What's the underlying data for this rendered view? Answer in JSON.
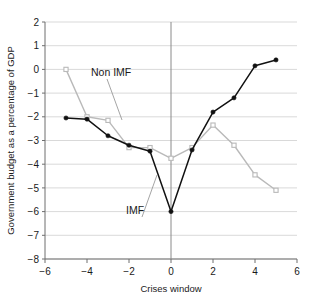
{
  "chart_data": {
    "type": "line",
    "title": "",
    "xlabel": "Crises window",
    "ylabel": "Government budget as a percentage of GDP",
    "xlim": [
      -6,
      6
    ],
    "ylim": [
      -8,
      2
    ],
    "xticks": [
      "-6",
      "-4",
      "-2",
      "0",
      "2",
      "4",
      "6"
    ],
    "xtick_values": [
      -6,
      -4,
      -2,
      0,
      2,
      4,
      6
    ],
    "yticks": [
      "2",
      "1",
      "0",
      "-1",
      "-2",
      "-3",
      "-4",
      "-5",
      "-6",
      "-7",
      "-8"
    ],
    "ytick_values": [
      2,
      1,
      0,
      -1,
      -2,
      -3,
      -4,
      -5,
      -6,
      -7,
      -8
    ],
    "grid": "horizontal",
    "legend_position": "inline-annotations",
    "x": [
      -5,
      -4,
      -3,
      -2,
      -1,
      0,
      1,
      2,
      3,
      4,
      5
    ],
    "series": [
      {
        "name": "IMF",
        "color": "#111111",
        "marker": "filled-circle",
        "values": [
          -2.05,
          -2.1,
          -2.8,
          -3.2,
          -3.45,
          -6.0,
          -3.4,
          -1.8,
          -1.2,
          0.15,
          0.4
        ]
      },
      {
        "name": "Non IMF",
        "color": "#b9b9b9",
        "marker": "open-square",
        "values": [
          0.0,
          -2.0,
          -2.15,
          -3.3,
          -3.3,
          -3.75,
          -3.3,
          -2.35,
          -3.2,
          -4.45,
          -5.1
        ]
      }
    ],
    "annotations": [
      {
        "text": "Non IMF",
        "x": 91,
        "y": 76,
        "leader_to_x": 122,
        "leader_to_y": 120
      },
      {
        "text": "IMF",
        "x": 126,
        "y": 214,
        "leader_to_x": 157,
        "leader_to_y": 175
      }
    ]
  }
}
